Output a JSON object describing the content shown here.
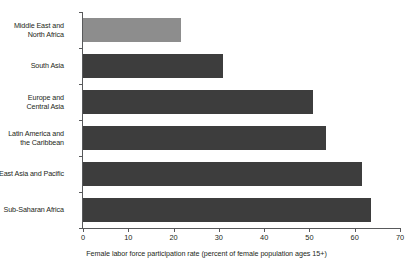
{
  "chart_data": {
    "type": "bar",
    "orientation": "horizontal",
    "title": "",
    "subtitle": "",
    "xlabel": "Female labor force participation rate (percent of female population ages 15+)",
    "ylabel": "",
    "xlim": [
      0,
      70
    ],
    "xticks": [
      0,
      10,
      20,
      30,
      40,
      50,
      60,
      70
    ],
    "xtick_labels": [
      "0",
      "10",
      "20",
      "30",
      "40",
      "50",
      "60",
      "70"
    ],
    "grid": false,
    "legend": null,
    "categories": [
      "Middle East and\nNorth Africa",
      "South Asia",
      "Europe and\nCentral Asia",
      "Latin America and\nthe Caribbean",
      "East Asia and Pacific",
      "Sub-Saharan Africa"
    ],
    "values": [
      21.6,
      30.9,
      50.8,
      53.6,
      61.6,
      63.6
    ],
    "bar_colors": [
      "#8d8d8d",
      "#3d3d3d",
      "#3d3d3d",
      "#3d3d3d",
      "#3d3d3d",
      "#3d3d3d"
    ],
    "series": [
      {
        "name": "Female labor force participation rate",
        "values": [
          21.6,
          30.9,
          50.8,
          53.6,
          61.6,
          63.6
        ]
      }
    ],
    "colors": {
      "highlight_bar": "#8d8d8d",
      "default_bar": "#3d3d3d",
      "axis": "#58595b",
      "text": "#231f20",
      "background": "#ffffff"
    }
  },
  "bars": [
    {
      "label": "Middle East and\nNorth Africa",
      "value": 21.6
    },
    {
      "label": "South Asia",
      "value": 30.9
    },
    {
      "label": "Europe and\nCentral Asia",
      "value": 50.8
    },
    {
      "label": "Latin America and\nthe Caribbean",
      "value": 53.6
    },
    {
      "label": "East Asia and Pacific",
      "value": 61.6
    },
    {
      "label": "Sub-Saharan Africa",
      "value": 63.6
    }
  ],
  "axis": {
    "ticks": [
      "0",
      "10",
      "20",
      "30",
      "40",
      "50",
      "60",
      "70"
    ],
    "title": "Female labor force participation rate (percent of female population ages 15+)"
  }
}
